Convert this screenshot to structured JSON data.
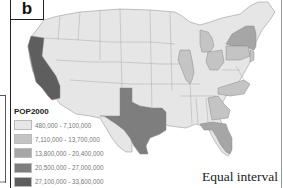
{
  "panel": {
    "label": "b"
  },
  "legend": {
    "title": "POP2000",
    "classes": [
      {
        "label": "480,000 - 7,100,000",
        "color": "#e6e6e6"
      },
      {
        "label": "7,110,000 - 13,700,000",
        "color": "#c4c4c4"
      },
      {
        "label": "13,800,000 - 20,400,000",
        "color": "#a6a6a6"
      },
      {
        "label": "20,500,000 - 27,000,000",
        "color": "#7e7e7e"
      },
      {
        "label": "27,100,000 - 33,600,000",
        "color": "#5e5e5e"
      }
    ]
  },
  "classification_method": "Equal interval",
  "map": {
    "subject": "United States (contiguous) population by state, 2000",
    "highlighted_states": [
      {
        "state": "California",
        "class": 5
      },
      {
        "state": "Texas",
        "class": 4
      },
      {
        "state": "New York",
        "class": 3
      },
      {
        "state": "Florida",
        "class": 3
      },
      {
        "state": "Illinois",
        "class": 2
      },
      {
        "state": "Pennsylvania",
        "class": 2
      },
      {
        "state": "Ohio",
        "class": 2
      },
      {
        "state": "Michigan",
        "class": 2
      },
      {
        "state": "Georgia",
        "class": 2
      },
      {
        "state": "North Carolina",
        "class": 2
      },
      {
        "state": "New Jersey",
        "class": 2
      }
    ],
    "other_states_class": 1
  }
}
